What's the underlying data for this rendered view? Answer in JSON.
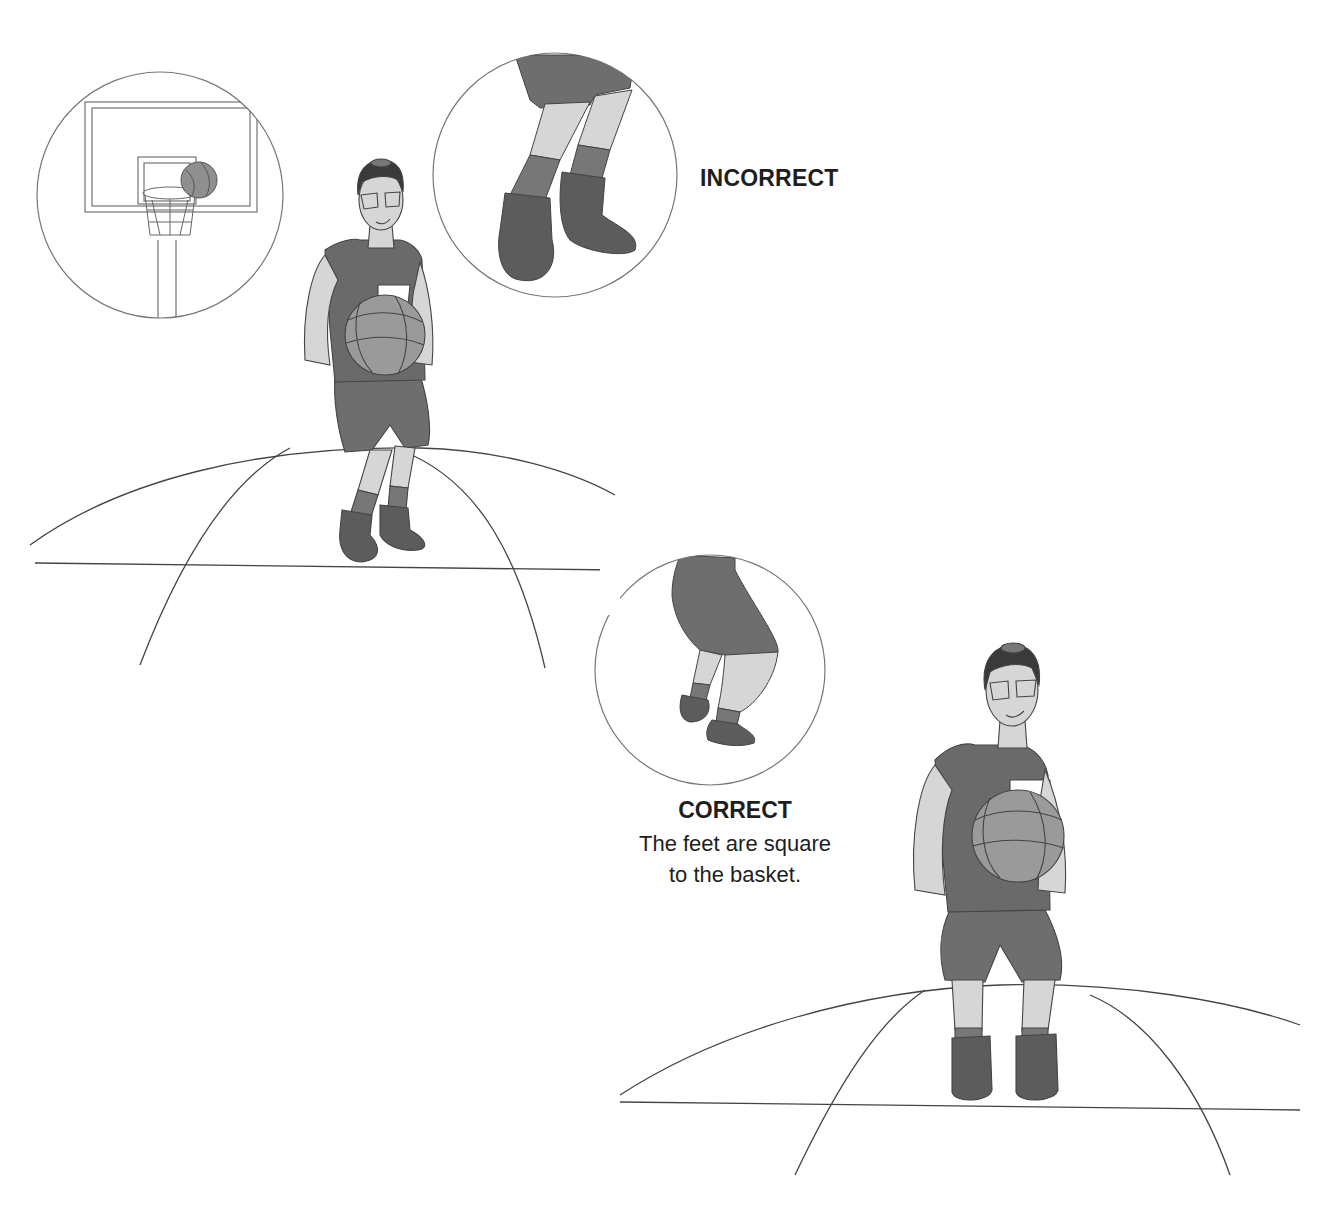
{
  "figure": {
    "top_text_fragment": "p                              p    g",
    "incorrect_label": "INCORRECT",
    "correct_label": "CORRECT",
    "correct_description_line1": "The feet are square",
    "correct_description_line2": "to the basket."
  },
  "colors": {
    "outline": "#555555",
    "skin": "#d6d6d6",
    "jersey": "#6a6a6a",
    "shorts": "#6e6e6e",
    "socks": "#777777",
    "shoes": "#5c5c5c",
    "ball": "#9a9a9a",
    "hair": "#3a3a3a",
    "court_line": "#444444"
  }
}
